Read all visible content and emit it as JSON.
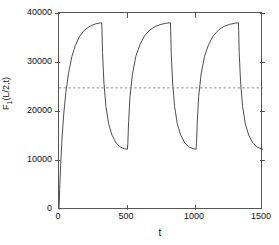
{
  "figure": {
    "background": "#ffffff",
    "frame_color": "#555555",
    "curve_color": "#3a3a3a",
    "dashed_color": "#777777"
  },
  "axes": {
    "y_title_main": "F",
    "y_title_sub": "1",
    "y_title_rest": "(L/2,t)",
    "x_title": "t",
    "y_ticks": [
      "0",
      "10000",
      "20000",
      "30000",
      "40000"
    ],
    "x_ticks": [
      "0",
      "500",
      "1000",
      "1500"
    ]
  },
  "chart_data": {
    "type": "line",
    "title": "",
    "subtitle": "",
    "xlabel": "t",
    "ylabel": "F1(L/2,t)",
    "xlim": [
      0,
      1500
    ],
    "ylim": [
      0,
      40000
    ],
    "xticks": [
      0,
      500,
      1000,
      1500
    ],
    "yticks": [
      0,
      10000,
      20000,
      30000,
      40000
    ],
    "grid": false,
    "legend": "none",
    "annotations": [
      {
        "kind": "horizontal-dashed-line",
        "y": 24800,
        "label": "reference level",
        "style": "dashed",
        "color": "#777777"
      }
    ],
    "series": [
      {
        "name": "F1(L/2,t)",
        "color": "#3a3a3a",
        "peak_value": 38000,
        "trough_value": 12300,
        "period": 505,
        "drop_times": [
          315,
          820,
          1320
        ],
        "rise_times": [
          505,
          1010
        ],
        "x": [
          0,
          5,
          12,
          22,
          35,
          50,
          70,
          95,
          120,
          150,
          180,
          210,
          240,
          270,
          295,
          310,
          314,
          316,
          320,
          330,
          345,
          365,
          390,
          420,
          450,
          480,
          500,
          503,
          506,
          512,
          522,
          540,
          565,
          595,
          630,
          670,
          710,
          750,
          790,
          815,
          819,
          821,
          825,
          835,
          850,
          870,
          895,
          925,
          955,
          985,
          1005,
          1008,
          1011,
          1017,
          1027,
          1045,
          1070,
          1100,
          1135,
          1175,
          1215,
          1255,
          1295,
          1316,
          1319,
          1321,
          1325,
          1335,
          1350,
          1370,
          1395,
          1425,
          1455,
          1485,
          1500
        ],
        "y": [
          0,
          4200,
          9000,
          14500,
          19500,
          23800,
          27800,
          31200,
          33400,
          35200,
          36300,
          37000,
          37500,
          37800,
          37950,
          38000,
          38000,
          36500,
          32000,
          26000,
          21000,
          17500,
          15200,
          13600,
          12800,
          12450,
          12350,
          12330,
          13500,
          18000,
          23000,
          27600,
          31200,
          33600,
          35400,
          36600,
          37300,
          37700,
          37930,
          38000,
          38000,
          36500,
          32000,
          26000,
          21000,
          17500,
          15200,
          13600,
          12800,
          12450,
          12350,
          12330,
          13500,
          18000,
          23000,
          27600,
          31200,
          33600,
          35400,
          36600,
          37300,
          37700,
          37930,
          38000,
          38000,
          36500,
          32000,
          26000,
          21000,
          17500,
          15200,
          13600,
          12800,
          12450,
          12330
        ]
      }
    ]
  }
}
